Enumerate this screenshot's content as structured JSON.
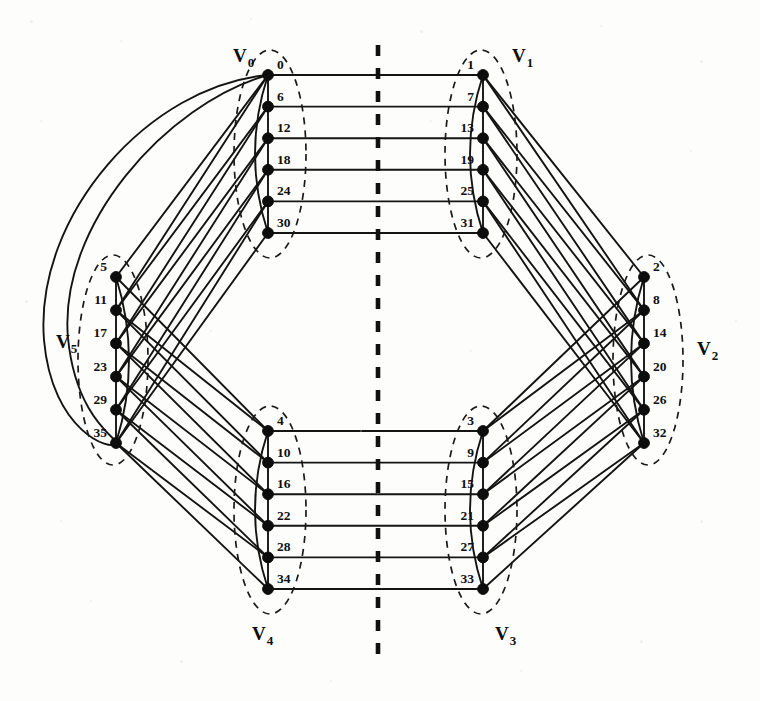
{
  "figure": {
    "caption": "",
    "background_color": "#fdfdfb",
    "ink_color": "#121212"
  },
  "mirror_axis": {
    "name": "symmetry-axis",
    "style": "dashed",
    "x": 378,
    "y_top": 45,
    "y_bottom": 658,
    "color": "#111111"
  },
  "groups": [
    {
      "id": "V0",
      "label": "V",
      "subscript": "0",
      "label_x": 233,
      "label_y": 62,
      "node_x": 268,
      "first_node_y": 75,
      "spacing": 31.6,
      "label_side": "right",
      "ellipse": {
        "cx": 270,
        "cy": 154,
        "rx": 36,
        "ry": 104,
        "rot": 0
      },
      "nodes": [
        {
          "id": 0,
          "label": "0"
        },
        {
          "id": 6,
          "label": "6"
        },
        {
          "id": 12,
          "label": "12"
        },
        {
          "id": 18,
          "label": "18"
        },
        {
          "id": 24,
          "label": "24"
        },
        {
          "id": 30,
          "label": "30"
        }
      ]
    },
    {
      "id": "V1",
      "label": "V",
      "subscript": "1",
      "label_x": 512,
      "label_y": 62,
      "node_x": 483,
      "first_node_y": 75,
      "spacing": 31.6,
      "label_side": "left",
      "ellipse": {
        "cx": 481,
        "cy": 154,
        "rx": 36,
        "ry": 104,
        "rot": 0
      },
      "nodes": [
        {
          "id": 1,
          "label": "1"
        },
        {
          "id": 7,
          "label": "7"
        },
        {
          "id": 13,
          "label": "13"
        },
        {
          "id": 19,
          "label": "19"
        },
        {
          "id": 25,
          "label": "25"
        },
        {
          "id": 31,
          "label": "31"
        }
      ]
    },
    {
      "id": "V2",
      "label": "V",
      "subscript": "2",
      "label_x": 697,
      "label_y": 355,
      "node_x": 644,
      "first_node_y": 277,
      "spacing": 33.2,
      "label_side": "right",
      "ellipse": {
        "cx": 648,
        "cy": 360,
        "rx": 35,
        "ry": 105,
        "rot": 0
      },
      "nodes": [
        {
          "id": 2,
          "label": "2"
        },
        {
          "id": 8,
          "label": "8"
        },
        {
          "id": 14,
          "label": "14"
        },
        {
          "id": 20,
          "label": "20"
        },
        {
          "id": 26,
          "label": "26"
        },
        {
          "id": 32,
          "label": "32"
        }
      ]
    },
    {
      "id": "V3",
      "label": "V",
      "subscript": "3",
      "label_x": 495,
      "label_y": 640,
      "node_x": 483,
      "first_node_y": 431,
      "spacing": 31.6,
      "label_side": "below",
      "ellipse": {
        "cx": 481,
        "cy": 510,
        "rx": 36,
        "ry": 104,
        "rot": 0
      },
      "nodes": [
        {
          "id": 3,
          "label": "3"
        },
        {
          "id": 9,
          "label": "9"
        },
        {
          "id": 15,
          "label": "15"
        },
        {
          "id": 21,
          "label": "21"
        },
        {
          "id": 27,
          "label": "27"
        },
        {
          "id": 33,
          "label": "33"
        }
      ]
    },
    {
      "id": "V4",
      "label": "V",
      "subscript": "4",
      "label_x": 252,
      "label_y": 640,
      "node_x": 268,
      "first_node_y": 431,
      "spacing": 31.6,
      "label_side": "below",
      "ellipse": {
        "cx": 270,
        "cy": 510,
        "rx": 36,
        "ry": 104,
        "rot": 0
      },
      "nodes": [
        {
          "id": 4,
          "label": "4"
        },
        {
          "id": 10,
          "label": "10"
        },
        {
          "id": 16,
          "label": "16"
        },
        {
          "id": 22,
          "label": "22"
        },
        {
          "id": 28,
          "label": "28"
        },
        {
          "id": 34,
          "label": "34"
        }
      ]
    },
    {
      "id": "V5",
      "label": "V",
      "subscript": "5",
      "label_x": 56,
      "label_y": 348,
      "node_x": 116,
      "first_node_y": 277,
      "spacing": 33.2,
      "label_side": "left",
      "ellipse": {
        "cx": 113,
        "cy": 360,
        "rx": 35,
        "ry": 105,
        "rot": 0
      },
      "nodes": [
        {
          "id": 5,
          "label": "5"
        },
        {
          "id": 11,
          "label": "11"
        },
        {
          "id": 17,
          "label": "17"
        },
        {
          "id": 23,
          "label": "23"
        },
        {
          "id": 29,
          "label": "29"
        },
        {
          "id": 35,
          "label": "35"
        }
      ]
    }
  ],
  "edges": {
    "V0_V1_horizontal": [
      [
        0,
        1
      ],
      [
        6,
        7
      ],
      [
        12,
        13
      ],
      [
        18,
        19
      ],
      [
        24,
        25
      ],
      [
        30,
        31
      ]
    ],
    "V4_V3_horizontal": [
      [
        4,
        3
      ],
      [
        10,
        9
      ],
      [
        16,
        15
      ],
      [
        22,
        21
      ],
      [
        28,
        27
      ],
      [
        34,
        33
      ]
    ],
    "V0_V5_diagonal": [
      [
        0,
        5
      ],
      [
        6,
        11
      ],
      [
        12,
        17
      ],
      [
        18,
        23
      ],
      [
        24,
        29
      ],
      [
        30,
        35
      ],
      [
        0,
        11
      ],
      [
        6,
        17
      ],
      [
        12,
        23
      ],
      [
        18,
        29
      ],
      [
        24,
        35
      ]
    ],
    "V5_V4_diagonal": [
      [
        5,
        4
      ],
      [
        11,
        10
      ],
      [
        17,
        16
      ],
      [
        23,
        22
      ],
      [
        29,
        28
      ],
      [
        35,
        34
      ],
      [
        11,
        4
      ],
      [
        17,
        10
      ],
      [
        23,
        16
      ],
      [
        29,
        22
      ],
      [
        35,
        28
      ]
    ],
    "V1_V2_diagonal": [
      [
        1,
        2
      ],
      [
        7,
        8
      ],
      [
        13,
        14
      ],
      [
        19,
        20
      ],
      [
        25,
        26
      ],
      [
        31,
        32
      ],
      [
        1,
        8
      ],
      [
        7,
        14
      ],
      [
        13,
        20
      ],
      [
        19,
        26
      ],
      [
        25,
        32
      ]
    ],
    "V2_V3_diagonal": [
      [
        2,
        3
      ],
      [
        8,
        9
      ],
      [
        14,
        15
      ],
      [
        20,
        21
      ],
      [
        26,
        27
      ],
      [
        32,
        33
      ],
      [
        8,
        3
      ],
      [
        14,
        9
      ],
      [
        20,
        15
      ],
      [
        26,
        21
      ],
      [
        32,
        27
      ]
    ],
    "within_group_spine": [
      "V0",
      "V1",
      "V2",
      "V3",
      "V4",
      "V5"
    ],
    "within_group_arc": [
      [
        0,
        30
      ],
      [
        1,
        31
      ],
      [
        2,
        32
      ],
      [
        3,
        33
      ],
      [
        4,
        34
      ],
      [
        5,
        35
      ]
    ],
    "long_wrap": [
      [
        0,
        35
      ]
    ]
  },
  "counts": {
    "vertices": 36,
    "parts": 6,
    "vertices_per_part": 6
  }
}
